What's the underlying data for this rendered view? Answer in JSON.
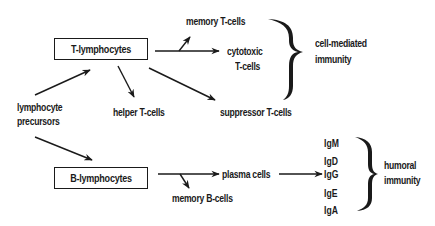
{
  "diagram": {
    "nodes": {
      "precursors": {
        "line1": "lymphocyte",
        "line2": "precursors"
      },
      "t_lymphocytes": "T-lymphocytes",
      "b_lymphocytes": "B-lymphocytes",
      "memory_t": "memory T-cells",
      "cytotoxic": {
        "line1": "cytotoxic",
        "line2": "T-cells"
      },
      "helper": "helper T-cells",
      "suppressor": "suppressor T-cells",
      "plasma": "plasma cells",
      "memory_b": "memory B-cells",
      "cell_mediated": {
        "line1": "cell-mediated",
        "line2": "immunity"
      },
      "humoral": {
        "line1": "humoral",
        "line2": "immunity"
      },
      "antibodies": [
        "IgM",
        "IgD",
        "IgG",
        "IgE",
        "IgA"
      ]
    },
    "edges": [
      {
        "from": "lymphocyte precursors",
        "to": "T-lymphocytes"
      },
      {
        "from": "lymphocyte precursors",
        "to": "B-lymphocytes"
      },
      {
        "from": "T-lymphocytes",
        "to": "cytotoxic T-cells"
      },
      {
        "from": "T-lymphocytes",
        "to": "memory T-cells"
      },
      {
        "from": "T-lymphocytes",
        "to": "helper T-cells"
      },
      {
        "from": "T-lymphocytes",
        "to": "suppressor T-cells"
      },
      {
        "from": "B-lymphocytes",
        "to": "plasma cells"
      },
      {
        "from": "B-lymphocytes",
        "to": "memory B-cells"
      },
      {
        "from": "plasma cells",
        "to": "IgG"
      }
    ],
    "groups": [
      {
        "brace": "right",
        "members": [
          "memory T-cells",
          "cytotoxic T-cells",
          "suppressor T-cells"
        ],
        "label": "cell-mediated immunity"
      },
      {
        "brace": "right",
        "members": [
          "IgM",
          "IgD",
          "IgG",
          "IgE",
          "IgA"
        ],
        "label": "humoral immunity"
      }
    ],
    "colors": {
      "ink": "#1a1a1a",
      "background": "#ffffff"
    }
  }
}
